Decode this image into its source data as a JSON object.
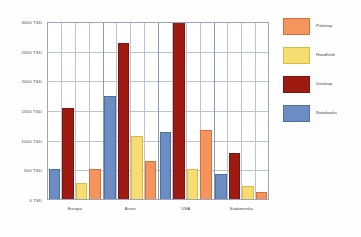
{
  "chart_data": {
    "type": "bar",
    "title": "",
    "subtitle": "",
    "xlabel": "",
    "ylabel": "",
    "categories": [
      "Europa",
      "Asien",
      "USA",
      "Südamerika"
    ],
    "series": [
      {
        "name": "Notebooks",
        "color": "#6b8dc4",
        "values": [
          520,
          1760,
          1150,
          430
        ]
      },
      {
        "name": "Desktop",
        "color": "#9e1b12",
        "values": [
          1550,
          2650,
          3000,
          790
        ]
      },
      {
        "name": "Handheld",
        "color": "#f7dc6f",
        "values": [
          290,
          1080,
          530,
          230
        ]
      },
      {
        "name": "Palmtop",
        "color": "#f5945c",
        "values": [
          520,
          650,
          1180,
          130
        ]
      }
    ],
    "legend_order": [
      "Palmtop",
      "Handheld",
      "Desktop",
      "Notebooks"
    ],
    "legend_position": "right",
    "ylim": [
      0,
      3000
    ],
    "yticks": [
      0,
      500,
      1000,
      1500,
      2000,
      2500,
      3000
    ],
    "ytick_labels": [
      "0 TSD",
      "500 TSD",
      "1000 TSD",
      "1500 TSD",
      "2000 TSD",
      "2500 TSD",
      "3000 TSD"
    ],
    "grid": {
      "horizontal": true,
      "vertical": true
    },
    "unit": "TSD"
  },
  "legend": {
    "items": [
      {
        "label": "Palmtop"
      },
      {
        "label": "Handheld"
      },
      {
        "label": "Desktop"
      },
      {
        "label": "Notebooks"
      }
    ]
  }
}
